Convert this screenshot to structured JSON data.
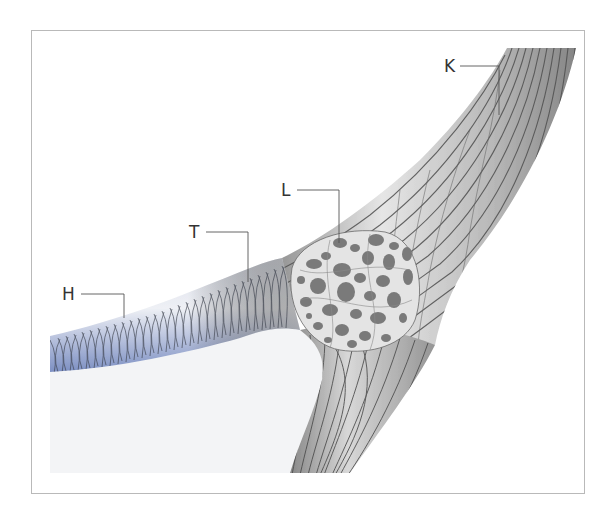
{
  "figure": {
    "colors": {
      "frame_border": "#b9b9b9",
      "tube_blue": "#8a9ccc",
      "tube_grid": "#3a3f4a",
      "band_gray": "#9a9a9a",
      "band_stripe": "#555555",
      "granule": "#7a7a7a",
      "background_pale": "#f3f4f6"
    },
    "labels": [
      {
        "id": "H",
        "text": "H",
        "x": 64,
        "y": 286
      },
      {
        "id": "T",
        "text": "T",
        "x": 191,
        "y": 224
      },
      {
        "id": "L",
        "text": "L",
        "x": 281,
        "y": 182
      },
      {
        "id": "K",
        "text": "K",
        "x": 445,
        "y": 58
      }
    ]
  }
}
